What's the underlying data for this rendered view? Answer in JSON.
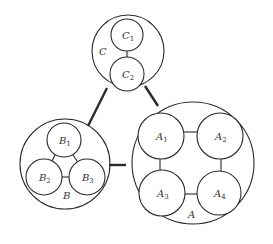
{
  "diagram": {
    "groups": [
      {
        "id": "C",
        "label": "C",
        "cx": 128,
        "cy": 51,
        "r": 36,
        "label_x": 99,
        "label_y": 55,
        "members": [
          {
            "id": "C1",
            "base": "C",
            "sub": "1",
            "cx": 127,
            "cy": 35,
            "r": 16
          },
          {
            "id": "C2",
            "base": "C",
            "sub": "2",
            "cx": 127,
            "cy": 74,
            "r": 17
          }
        ]
      },
      {
        "id": "B",
        "label": "B",
        "cx": 65,
        "cy": 164,
        "r": 45,
        "label_x": 63,
        "label_y": 199,
        "members": [
          {
            "id": "B1",
            "base": "B",
            "sub": "1",
            "cx": 64,
            "cy": 140,
            "r": 17
          },
          {
            "id": "B2",
            "base": "B",
            "sub": "2",
            "cx": 44,
            "cy": 177,
            "r": 18
          },
          {
            "id": "B3",
            "base": "B",
            "sub": "3",
            "cx": 87,
            "cy": 177,
            "r": 18
          }
        ]
      },
      {
        "id": "A",
        "label": "A",
        "cx": 193,
        "cy": 163,
        "r": 61,
        "label_x": 188,
        "label_y": 218,
        "members": [
          {
            "id": "A1",
            "base": "A",
            "sub": "1",
            "cx": 161,
            "cy": 136,
            "r": 23
          },
          {
            "id": "A2",
            "base": "A",
            "sub": "2",
            "cx": 220,
            "cy": 136,
            "r": 23
          },
          {
            "id": "A3",
            "base": "A",
            "sub": "3",
            "cx": 162,
            "cy": 193,
            "r": 23
          },
          {
            "id": "A4",
            "base": "A",
            "sub": "4",
            "cx": 219,
            "cy": 193,
            "r": 22
          }
        ]
      }
    ],
    "inner_links": [
      {
        "from": "C1",
        "to": "C2",
        "x1": 127,
        "y1": 51,
        "x2": 127,
        "y2": 57
      },
      {
        "from": "B1",
        "to": "B2",
        "x1": 55,
        "y1": 155,
        "x2": 52,
        "y2": 161
      },
      {
        "from": "B1",
        "to": "B3",
        "x1": 73,
        "y1": 155,
        "x2": 77,
        "y2": 161
      },
      {
        "from": "B2",
        "to": "B3",
        "x1": 62,
        "y1": 177,
        "x2": 69,
        "y2": 177
      },
      {
        "from": "A1",
        "to": "A2",
        "x1": 184,
        "y1": 132,
        "x2": 197,
        "y2": 132
      },
      {
        "from": "A1",
        "to": "A3",
        "x1": 160,
        "y1": 159,
        "x2": 160,
        "y2": 170
      },
      {
        "from": "A2",
        "to": "A4",
        "x1": 221,
        "y1": 159,
        "x2": 221,
        "y2": 171
      },
      {
        "from": "A3",
        "to": "A4",
        "x1": 185,
        "y1": 194,
        "x2": 197,
        "y2": 194
      }
    ],
    "outer_links": [
      {
        "from": "C",
        "to": "B",
        "x1": 107,
        "y1": 88,
        "x2": 88,
        "y2": 126
      },
      {
        "from": "C",
        "to": "A",
        "x1": 145,
        "y1": 86,
        "x2": 158,
        "y2": 106
      },
      {
        "from": "B",
        "to": "A",
        "x1": 109,
        "y1": 165,
        "x2": 126,
        "y2": 165
      }
    ],
    "stroke_color": "#2a2a2a"
  }
}
